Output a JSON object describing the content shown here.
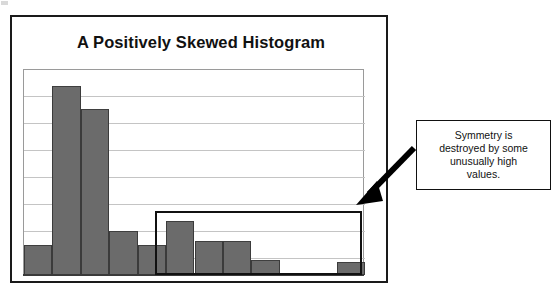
{
  "figure": {
    "title": "A Positively Skewed Histogram",
    "callout": {
      "lines": [
        "Symmetry is",
        "destroyed by some",
        "unusually high",
        "values."
      ],
      "full_text": "Symmetry is destroyed by some unusually high values."
    },
    "colors": {
      "bar_fill": "#6b6b6b",
      "bar_outline": "#3b3b3b",
      "frame": "#1a1a1a",
      "gridline": "#c4c4c4",
      "highlight_box": "#111111",
      "arrow": "#000000",
      "background": "#ffffff"
    }
  },
  "chart_data": {
    "type": "bar",
    "title": "A Positively Skewed Histogram",
    "xlabel": "",
    "ylabel": "",
    "categories": [
      "1",
      "2",
      "3",
      "4",
      "5",
      "6",
      "7",
      "8",
      "9",
      "10",
      "11",
      "12"
    ],
    "values": [
      1.1,
      7.0,
      6.15,
      1.65,
      1.1,
      2.0,
      1.25,
      1.25,
      0.55,
      0,
      0,
      0.5
    ],
    "ylim": [
      0,
      7.6
    ],
    "grid": true,
    "gridline_count": 7,
    "legend": false,
    "annotations": [
      {
        "type": "rectangle",
        "label": "tail-highlight",
        "covers_categories": [
          "6",
          "7",
          "8",
          "9",
          "10",
          "11",
          "12"
        ]
      },
      {
        "type": "arrow",
        "label": "callout-arrow",
        "points_to": "tail-highlight top-right corner"
      },
      {
        "type": "textbox",
        "label": "callout",
        "text": "Symmetry is destroyed by some unusually high values."
      }
    ]
  }
}
